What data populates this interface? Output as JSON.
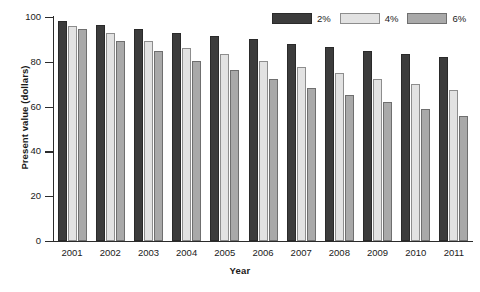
{
  "chart_data": {
    "type": "bar",
    "title": "",
    "xlabel": "Year",
    "ylabel": "Present value (dollars)",
    "categories": [
      "2001",
      "2002",
      "2003",
      "2004",
      "2005",
      "2006",
      "2007",
      "2008",
      "2009",
      "2010",
      "2011"
    ],
    "series": [
      {
        "name": "2%",
        "color": "#3c3c3c",
        "values": [
          98,
          96.5,
          94.5,
          93,
          91.5,
          90,
          88,
          86.5,
          85,
          83.5,
          82
        ]
      },
      {
        "name": "4%",
        "color": "#e2e2e2",
        "values": [
          96,
          93,
          89.5,
          86,
          83.5,
          80.5,
          77.5,
          75,
          72.5,
          70,
          67.5
        ]
      },
      {
        "name": "6%",
        "color": "#a9a9a9",
        "values": [
          94.5,
          89.5,
          85,
          80.5,
          76.5,
          72.5,
          68.5,
          65,
          62,
          59,
          56
        ]
      }
    ],
    "ylim": [
      0,
      100
    ],
    "yticks": [
      0,
      20,
      40,
      60,
      80,
      100
    ],
    "ytick_labels": [
      "0",
      "20",
      "40",
      "60",
      "80",
      "100"
    ],
    "grid": false,
    "legend_position": "top-right"
  }
}
